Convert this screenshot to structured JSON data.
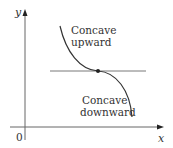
{
  "diagram": {
    "axes": {
      "x_label": "x",
      "y_label": "y",
      "origin_label": "0"
    },
    "labels": {
      "upper_line1": "Concave",
      "upper_line2": "upward",
      "lower_line1": "Concave",
      "lower_line2": "downward"
    },
    "colors": {
      "line": "#333333",
      "axis": "#555555",
      "tangent": "#555555",
      "point": "#222222"
    }
  }
}
